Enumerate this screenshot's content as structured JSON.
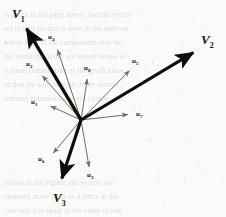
{
  "figure": {
    "caption_present": false,
    "origin": {
      "x": 81,
      "y": 120
    },
    "colors": {
      "background": "#fbfaf8",
      "major_vector": "#100d0a",
      "minor_vector": "#6f6a64",
      "label_text": "#15120f",
      "bleed_text": "#9a958f"
    },
    "major_vectors": [
      {
        "id": "V1",
        "label": "V",
        "subscript": "1",
        "tip": {
          "x": 22,
          "y": 21
        },
        "label_pos": {
          "x": 12,
          "y": 6
        },
        "width": 3.4
      },
      {
        "id": "V2",
        "label": "V",
        "subscript": "2",
        "tip": {
          "x": 201,
          "y": 48
        },
        "label_pos": {
          "x": 201,
          "y": 32
        },
        "width": 3.2
      },
      {
        "id": "V3",
        "label": "V",
        "subscript": "3",
        "tip": {
          "x": 59,
          "y": 187
        },
        "label_pos": {
          "x": 53,
          "y": 190
        },
        "width": 3.2
      }
    ],
    "minor_vectors": [
      {
        "id": "u1",
        "label": "u",
        "subscript": "1",
        "tip": {
          "x": 46,
          "y": 104
        },
        "label_pos": {
          "x": 31,
          "y": 98
        },
        "width": 1
      },
      {
        "id": "u2",
        "label": "u",
        "subscript": "2",
        "tip": {
          "x": 39,
          "y": 72
        },
        "label_pos": {
          "x": 26,
          "y": 60
        },
        "width": 1
      },
      {
        "id": "u3",
        "label": "u",
        "subscript": "3",
        "tip": {
          "x": 90,
          "y": 172
        },
        "label_pos": {
          "x": 87,
          "y": 171
        },
        "width": 1
      },
      {
        "id": "u4",
        "label": "u",
        "subscript": "4",
        "tip": {
          "x": 56,
          "y": 45
        },
        "label_pos": {
          "x": 48,
          "y": 33
        },
        "width": 1
      },
      {
        "id": "u5",
        "label": "u",
        "subscript": "5",
        "tip": {
          "x": 133,
          "y": 67
        },
        "label_pos": {
          "x": 132,
          "y": 57
        },
        "width": 1
      },
      {
        "id": "u6",
        "label": "u",
        "subscript": "6",
        "tip": {
          "x": 50,
          "y": 157
        },
        "label_pos": {
          "x": 38,
          "y": 155
        },
        "width": 1
      },
      {
        "id": "u7",
        "label": "u",
        "subscript": "7",
        "tip": {
          "x": 133,
          "y": 114
        },
        "label_pos": {
          "x": 136,
          "y": 110
        },
        "width": 1
      },
      {
        "id": "u8",
        "label": "u",
        "subscript": "8",
        "tip": {
          "x": 88,
          "y": 74
        },
        "label_pos": {
          "x": 84,
          "y": 64
        },
        "width": 1
      }
    ],
    "background_text_lines": [
      {
        "y": 12,
        "text": "is given in the page above, and the vector"
      },
      {
        "y": 26,
        "text": "set of unit vectors is used in the analysis"
      },
      {
        "y": 40,
        "text": "where each of the components may be"
      },
      {
        "y": 54,
        "text": "the resulting values are shown below as"
      },
      {
        "y": 68,
        "text": "a linear combination of the given basis"
      },
      {
        "y": 82,
        "text": "so that the sum over all of the indices"
      },
      {
        "y": 96,
        "text": "remains bounded for every choice of n"
      },
      {
        "y": 180,
        "text": "shown in the Figure, the vectors are"
      },
      {
        "y": 194,
        "text": "obtained in the limit as n tends to the"
      },
      {
        "y": 208,
        "text": "case and it is equal to the value of one"
      }
    ]
  }
}
